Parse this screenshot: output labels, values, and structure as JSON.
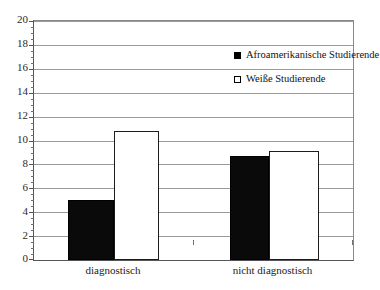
{
  "chart_data": {
    "type": "bar",
    "title": "",
    "subtitle": "",
    "xlabel": "",
    "ylabel": "",
    "categories": [
      "diagnostisch",
      "nicht diagnostisch"
    ],
    "series": [
      {
        "name": "Afroamerikanische Studierende",
        "marker": "filled-square",
        "color": "#000000",
        "values": [
          5.0,
          8.7
        ]
      },
      {
        "name": "Weiße Studierende",
        "marker": "open-square",
        "color": "#ffffff",
        "values": [
          10.8,
          9.1
        ]
      }
    ],
    "ylim": [
      0,
      20
    ],
    "ytick_step": 2,
    "yticks": [
      0,
      2,
      4,
      6,
      8,
      10,
      12,
      14,
      16,
      18,
      20
    ],
    "ytick_labels": [
      "0",
      "2",
      "4",
      "6",
      "8",
      "10",
      "12",
      "14",
      "16",
      "18",
      "20"
    ],
    "minor_ticks": true,
    "minor_tick_step": 0.5,
    "grid": true,
    "grid_axis": "y",
    "legend_position": "top-right-inside",
    "frame": true
  },
  "legend": {
    "items": [
      {
        "label": "Afroamerikanische Studierende",
        "marker": "filled-square"
      },
      {
        "label": "Weiße Studierende",
        "marker": "open-square"
      }
    ]
  },
  "axis": {
    "x_labels": [
      "diagnostisch",
      "nicht diagnostisch"
    ],
    "y_labels": [
      "20",
      "18",
      "16",
      "14",
      "12",
      "10",
      "8",
      "6",
      "4",
      "2",
      "0"
    ]
  }
}
